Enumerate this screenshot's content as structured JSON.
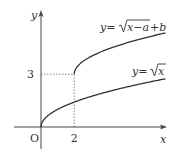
{
  "chart_data": {
    "type": "line",
    "title": "",
    "xlabel": "x",
    "ylabel": "y",
    "origin_label": "O",
    "x_ticks": [
      {
        "value": 2,
        "label": "2"
      }
    ],
    "y_ticks": [
      {
        "value": 3,
        "label": "3"
      }
    ],
    "xlim": [
      -1.6,
      7.6
    ],
    "ylim": [
      -1.0,
      6.5
    ],
    "grid": false,
    "series": [
      {
        "name": "y=√(x−a)+b",
        "label_parts": {
          "pre": "y=",
          "radicand": "x−a",
          "post": "+b"
        },
        "function": "sqrt(x-2)+3",
        "domain": [
          2,
          7.5
        ],
        "start_point": [
          2,
          3
        ]
      },
      {
        "name": "y=√x",
        "label_parts": {
          "pre": "y=",
          "radicand": "x",
          "post": ""
        },
        "function": "sqrt(x)",
        "domain": [
          0,
          7.5
        ],
        "start_point": [
          0,
          0
        ]
      }
    ],
    "guides": [
      {
        "from": [
          0,
          3
        ],
        "to": [
          2,
          3
        ],
        "style": "dotted"
      },
      {
        "from": [
          2,
          0
        ],
        "to": [
          2,
          3
        ],
        "style": "dotted"
      }
    ]
  }
}
